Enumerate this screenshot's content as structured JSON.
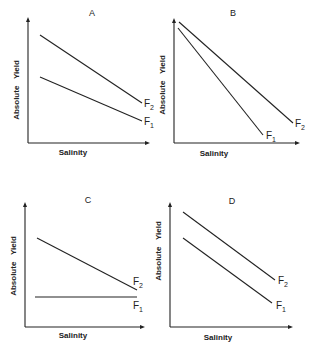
{
  "chart_data": [
    {
      "type": "line",
      "panel": "A",
      "title": "A",
      "xlabel": "Salinity",
      "ylabel": "Absolute Yield",
      "grid": false,
      "axis_ticks": "none",
      "box": {
        "x0": 28,
        "y0": 143,
        "x1": 150,
        "ytop": 17,
        "ylabel_x": 17,
        "ylabel_y": 90,
        "xlabel_x": 73,
        "xlabel_y": 155,
        "title_x": 92,
        "title_y": 16
      },
      "series": [
        {
          "name": "F2",
          "main": "F",
          "sub": "2",
          "points": [
            [
              40,
              35
            ],
            [
              142,
              103
            ]
          ],
          "label_pos": [
            144,
            107
          ]
        },
        {
          "name": "F1",
          "main": "F",
          "sub": "1",
          "points": [
            [
              40,
              77
            ],
            [
              142,
              121
            ]
          ],
          "label_pos": [
            144,
            125
          ]
        }
      ],
      "description": "Both decline with salinity; F2 higher and steeper, lines converge at high salinity"
    },
    {
      "type": "line",
      "panel": "B",
      "title": "B",
      "xlabel": "Salinity",
      "ylabel": "Absolute Yield",
      "grid": false,
      "axis_ticks": "none",
      "box": {
        "x0": 174,
        "y0": 143,
        "x1": 300,
        "ytop": 18,
        "ylabel_x": 163,
        "ylabel_y": 85,
        "xlabel_x": 214,
        "xlabel_y": 156,
        "title_x": 233,
        "title_y": 16
      },
      "series": [
        {
          "name": "F2",
          "main": "F",
          "sub": "2",
          "points": [
            [
              179,
              22
            ],
            [
              293,
              123
            ]
          ],
          "label_pos": [
            295,
            127
          ]
        },
        {
          "name": "F1",
          "main": "F",
          "sub": "1",
          "points": [
            [
              178,
              28
            ],
            [
              263,
              135
            ]
          ],
          "label_pos": [
            266,
            139
          ]
        }
      ],
      "description": "Both start at nearly same yield at low salinity; F1 declines more steeply, lines diverge"
    },
    {
      "type": "line",
      "panel": "C",
      "title": "C",
      "xlabel": "Salinity",
      "ylabel": "Absolute Yield",
      "grid": false,
      "axis_ticks": "none",
      "box": {
        "x0": 25,
        "y0": 327,
        "x1": 145,
        "ytop": 202,
        "ylabel_x": 14,
        "ylabel_y": 266,
        "xlabel_x": 73,
        "xlabel_y": 338,
        "title_x": 88,
        "title_y": 203
      },
      "series": [
        {
          "name": "F2",
          "main": "F",
          "sub": "2",
          "points": [
            [
              37,
              238
            ],
            [
              137,
              290
            ]
          ],
          "label_pos": [
            133,
            285
          ]
        },
        {
          "name": "F1",
          "main": "F",
          "sub": "1",
          "points": [
            [
              35,
              297
            ],
            [
              137,
              297
            ]
          ],
          "label_pos": [
            133,
            309
          ]
        }
      ],
      "description": "F2 declines with salinity toward F1; F1 is flat (constant yield)"
    },
    {
      "type": "line",
      "panel": "D",
      "title": "D",
      "xlabel": "Salinity",
      "ylabel": "Absolute Yield",
      "grid": false,
      "axis_ticks": "none",
      "box": {
        "x0": 170,
        "y0": 327,
        "x1": 293,
        "ytop": 202,
        "ylabel_x": 159,
        "ylabel_y": 251,
        "xlabel_x": 218,
        "xlabel_y": 340,
        "title_x": 232,
        "title_y": 204
      },
      "series": [
        {
          "name": "F2",
          "main": "F",
          "sub": "2",
          "points": [
            [
              183,
              212
            ],
            [
              275,
              280
            ]
          ],
          "label_pos": [
            278,
            284
          ]
        },
        {
          "name": "F1",
          "main": "F",
          "sub": "1",
          "points": [
            [
              183,
              238
            ],
            [
              272,
              303
            ]
          ],
          "label_pos": [
            276,
            309
          ]
        }
      ],
      "description": "Parallel declining lines; F2 consistently above F1"
    }
  ],
  "panels": [
    {
      "title": "A",
      "xlabel": "Salinity",
      "ylabel": "Absolute Yield"
    },
    {
      "title": "B",
      "xlabel": "Salinity",
      "ylabel": "Absolute Yield"
    },
    {
      "title": "C",
      "xlabel": "Salinity",
      "ylabel": "Absolute Yield"
    },
    {
      "title": "D",
      "xlabel": "Salinity",
      "ylabel": "Absolute Yield"
    }
  ],
  "colors": {
    "ink": "#222222",
    "background": "#ffffff"
  }
}
